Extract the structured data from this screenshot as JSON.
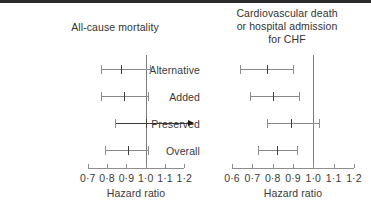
{
  "chart_data": {
    "type": "table",
    "chart_kind": "forest-plot",
    "title": "",
    "grid": false,
    "legend": "none",
    "categories": [
      "Alternative",
      "Added",
      "Preserved",
      "Overall"
    ],
    "panels": [
      {
        "id": "all-cause-mortality",
        "title": "All-cause mortality",
        "xlabel": "Hazard ratio",
        "ylabel": "",
        "xlim": [
          0.67,
          1.24
        ],
        "ticks": [
          0.7,
          0.8,
          0.9,
          1.0,
          1.1,
          1.2
        ],
        "tick_labels": [
          "0·7",
          "0·8",
          "0·9",
          "1·0",
          "1·1",
          "1·2"
        ],
        "null_value": 1.0,
        "rows": [
          {
            "label": "Alternative",
            "estimate": 0.87,
            "lower": 0.77,
            "upper": 1.02,
            "truncated_right": false
          },
          {
            "label": "Added",
            "estimate": 0.89,
            "lower": 0.77,
            "upper": 1.01,
            "truncated_right": false
          },
          {
            "label": "Preserved",
            "estimate": 1.0,
            "lower": 0.84,
            "upper": 1.24,
            "truncated_right": true
          },
          {
            "label": "Overall",
            "estimate": 0.91,
            "lower": 0.79,
            "upper": 1.01,
            "truncated_right": false
          }
        ]
      },
      {
        "id": "cv-death-or-chf-admission",
        "title": "Cardiovascular death\nor hospital admission\nfor CHF",
        "xlabel": "Hazard ratio",
        "ylabel": "",
        "xlim": [
          0.58,
          1.23
        ],
        "ticks": [
          0.6,
          0.7,
          0.8,
          0.9,
          1.0,
          1.1,
          1.2
        ],
        "tick_labels": [
          "0·6",
          "0·7",
          "0·8",
          "0·9",
          "1·0",
          "1·1",
          "1·2"
        ],
        "null_value": 1.0,
        "rows": [
          {
            "label": "Alternative",
            "estimate": 0.77,
            "lower": 0.64,
            "upper": 0.9,
            "truncated_right": false
          },
          {
            "label": "Added",
            "estimate": 0.8,
            "lower": 0.69,
            "upper": 0.93,
            "truncated_right": false
          },
          {
            "label": "Preserved",
            "estimate": 0.89,
            "lower": 0.77,
            "upper": 1.03,
            "truncated_right": false
          },
          {
            "label": "Overall",
            "estimate": 0.82,
            "lower": 0.73,
            "upper": 0.92,
            "truncated_right": false
          }
        ]
      }
    ]
  },
  "panel_left": {
    "title": "All-cause mortality",
    "axis_title": "Hazard ratio",
    "tick_labels": [
      "0·7",
      "0·8",
      "0·9",
      "1·0",
      "1·1",
      "1·2"
    ]
  },
  "panel_right": {
    "title": "Cardiovascular death\nor hospital admission\nfor CHF",
    "axis_title": "Hazard ratio",
    "tick_labels": [
      "0·6",
      "0·7",
      "0·8",
      "0·9",
      "1·0",
      "1·1",
      "1·2"
    ]
  },
  "row_labels": [
    "Alternative",
    "Added",
    "Preserved",
    "Overall"
  ],
  "colors": {
    "background": "#ffffff",
    "text": "#3a3a3a",
    "axis": "#8e8e8e",
    "null_line": "#7d7d7d",
    "ci": "#888888",
    "marker": "#3f3f3f",
    "arrow": "#1c1c1c",
    "top_border": "#2b2b2b"
  }
}
